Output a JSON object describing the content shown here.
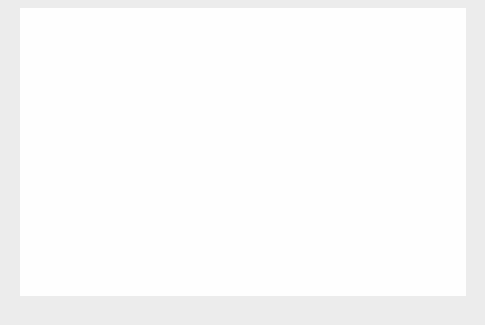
{
  "figure": {
    "background_color": "#ececec",
    "panel_color": "#fefefe",
    "axis_color": "#1a1a1a",
    "point_color": "#111111",
    "solid_line_color": "#4a4a4a",
    "dashed_line_color": "#111111"
  },
  "chart_data": {
    "type": "scatter",
    "title": "",
    "xlabel": "Bots (thousands)",
    "ylabel": "Spams per day (billions)",
    "xlim": [
      0,
      400
    ],
    "ylim": [
      0,
      60
    ],
    "xticks": [
      0,
      100,
      200,
      300,
      400
    ],
    "yticks": [
      0,
      10,
      20,
      30,
      40,
      50,
      60
    ],
    "xtick_labels": [
      "0",
      "100",
      "200",
      "300",
      "400"
    ],
    "ytick_labels": [
      "0",
      "10",
      "20",
      "30",
      "40",
      "50",
      "60"
    ],
    "grid": false,
    "legend": "none",
    "points": [
      {
        "x": 14,
        "y": 0.4
      },
      {
        "x": 22,
        "y": 0.6
      },
      {
        "x": 26,
        "y": 2.2
      },
      {
        "x": 31,
        "y": 5.2
      },
      {
        "x": 38,
        "y": 10.0
      },
      {
        "x": 48,
        "y": 0.6
      },
      {
        "x": 62,
        "y": 1.0
      },
      {
        "x": 84,
        "y": 1.8
      },
      {
        "x": 88,
        "y": 5.0
      },
      {
        "x": 97,
        "y": 12.4
      },
      {
        "x": 124,
        "y": 16.2
      },
      {
        "x": 133,
        "y": 11.4
      },
      {
        "x": 145,
        "y": 30.2
      },
      {
        "x": 179,
        "y": 8.8
      },
      {
        "x": 315,
        "y": 60.0
      }
    ],
    "series": [
      {
        "name": "solid-fit-line",
        "style": "solid",
        "x": [
          2,
          370
        ],
        "y": [
          0,
          60
        ]
      },
      {
        "name": "dashed-fit-line",
        "style": "dashed",
        "x": [
          22,
          315
        ],
        "y": [
          0,
          60
        ]
      }
    ]
  }
}
